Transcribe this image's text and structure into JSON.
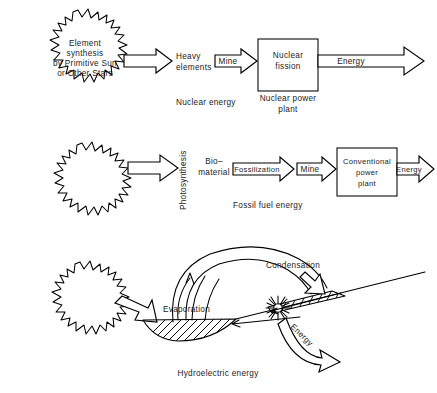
{
  "figure": {
    "kind": "energy-flow-diagram",
    "background": "#ffffff",
    "ink": "#000000"
  },
  "rows": {
    "nuclear": {
      "source_label_lines": [
        "Element",
        "synthesis",
        "by Primitive Sun",
        "or Other Stars"
      ],
      "product_lines": [
        "Heavy",
        "elements"
      ],
      "process_label": "Mine",
      "plant_box_lines": [
        "Nuclear",
        "fission"
      ],
      "plant_caption_lines": [
        "Nuclear power",
        "plant"
      ],
      "output_label": "Energy",
      "caption": "Nuclear energy"
    },
    "fossil": {
      "conversion_label": "Photosynthesis",
      "product_lines": [
        "Bio–",
        "material"
      ],
      "process_label_1": "Fossilization",
      "process_label_2": "Mine",
      "plant_box_lines": [
        "Conventional",
        "power",
        "plant"
      ],
      "output_label": "Energy",
      "caption": "Fossil fuel energy"
    },
    "hydro": {
      "evaporation_label": "Evaporation",
      "condensation_label": "Condensation",
      "output_label": "Energy",
      "caption": "Hydroelectric energy"
    }
  }
}
